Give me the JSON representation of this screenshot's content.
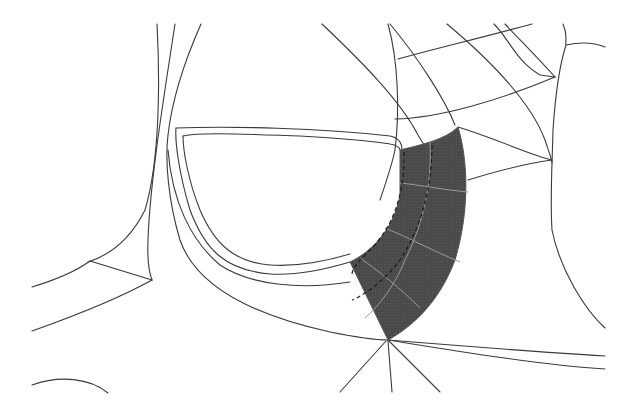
{
  "diagram": {
    "type": "surface-patch-layout",
    "colors": {
      "background": "#ffffff",
      "line": "#3a3a3a",
      "patch_fill": "#4a4a4a",
      "patch_grid": "#9a9a9a"
    },
    "highlighted_patch": {
      "shape": "curved-quarter-band",
      "grid_rows": 4,
      "grid_cols": 3
    }
  }
}
